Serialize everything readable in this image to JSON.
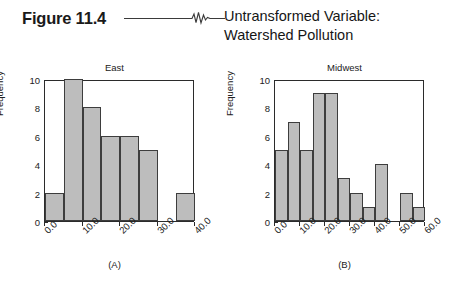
{
  "figure": {
    "number": "Figure 11.4",
    "title_line1": "Untransformed Variable:",
    "title_line2": "Watershed Pollution",
    "rule_icon": "horizontal-rule",
    "squiggle_icon": "ekg-squiggle-icon"
  },
  "colors": {
    "bar_fill": "#bdbdbd",
    "bar_stroke": "#3d3d3d",
    "axis": "#2b2b2b",
    "text": "#1a1a1a",
    "background": "#ffffff"
  },
  "chart_data": [
    {
      "type": "bar",
      "title": "East",
      "caption": "(A)",
      "xlabel": "",
      "ylabel": "Frequency",
      "xlim": [
        0,
        40
      ],
      "ylim": [
        0,
        10
      ],
      "bin_width": 5,
      "grid": false,
      "legend": "none",
      "xticks": [
        0,
        10,
        20,
        30,
        40
      ],
      "xtick_labels": [
        "0.0",
        "10.0",
        "20.0",
        "30.0",
        "40.0"
      ],
      "yticks": [
        0,
        2,
        4,
        6,
        8,
        10
      ],
      "ytick_labels": [
        "0",
        "2",
        "4",
        "6",
        "8",
        "10"
      ],
      "bin_edges": [
        0,
        5,
        10,
        15,
        20,
        25,
        30,
        35,
        40
      ],
      "categories": [
        "0-5",
        "5-10",
        "10-15",
        "15-20",
        "20-25",
        "25-30",
        "30-35",
        "35-40"
      ],
      "values": [
        2,
        10,
        8,
        6,
        6,
        5,
        0,
        2
      ]
    },
    {
      "type": "bar",
      "title": "Midwest",
      "caption": "(B)",
      "xlabel": "",
      "ylabel": "Frequency",
      "xlim": [
        0,
        60
      ],
      "ylim": [
        0,
        10
      ],
      "bin_width": 5,
      "grid": false,
      "legend": "none",
      "xticks": [
        0,
        10,
        20,
        30,
        40,
        50,
        60
      ],
      "xtick_labels": [
        "0.0",
        "10.0",
        "20.0",
        "30.0",
        "40.0",
        "50.0",
        "60.0"
      ],
      "yticks": [
        0,
        2,
        4,
        6,
        8,
        10
      ],
      "ytick_labels": [
        "0",
        "2",
        "4",
        "6",
        "8",
        "10"
      ],
      "bin_edges": [
        0,
        5,
        10,
        15,
        20,
        25,
        30,
        35,
        40,
        45,
        50,
        55,
        60
      ],
      "categories": [
        "0-5",
        "5-10",
        "10-15",
        "15-20",
        "20-25",
        "25-30",
        "30-35",
        "35-40",
        "40-45",
        "45-50",
        "50-55",
        "55-60"
      ],
      "values": [
        5,
        7,
        5,
        9,
        9,
        3,
        2,
        1,
        4,
        0,
        2,
        1
      ]
    }
  ]
}
